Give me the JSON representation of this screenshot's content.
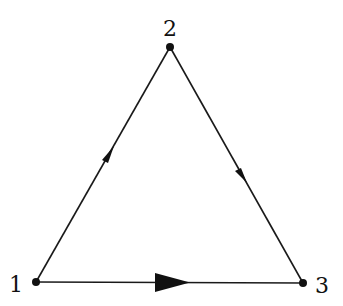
{
  "diagram": {
    "type": "directed-graph",
    "nodes": [
      {
        "id": "1",
        "label": "1",
        "x": 36,
        "y": 282
      },
      {
        "id": "2",
        "label": "2",
        "x": 170,
        "y": 47
      },
      {
        "id": "3",
        "label": "3",
        "x": 303,
        "y": 283
      }
    ],
    "edges": [
      {
        "from": "1",
        "to": "2",
        "arrow": "small"
      },
      {
        "from": "2",
        "to": "3",
        "arrow": "small"
      },
      {
        "from": "1",
        "to": "3",
        "arrow": "large"
      }
    ],
    "colors": {
      "line": "#1a1a1a",
      "node": "#111111",
      "background": "#ffffff"
    }
  }
}
